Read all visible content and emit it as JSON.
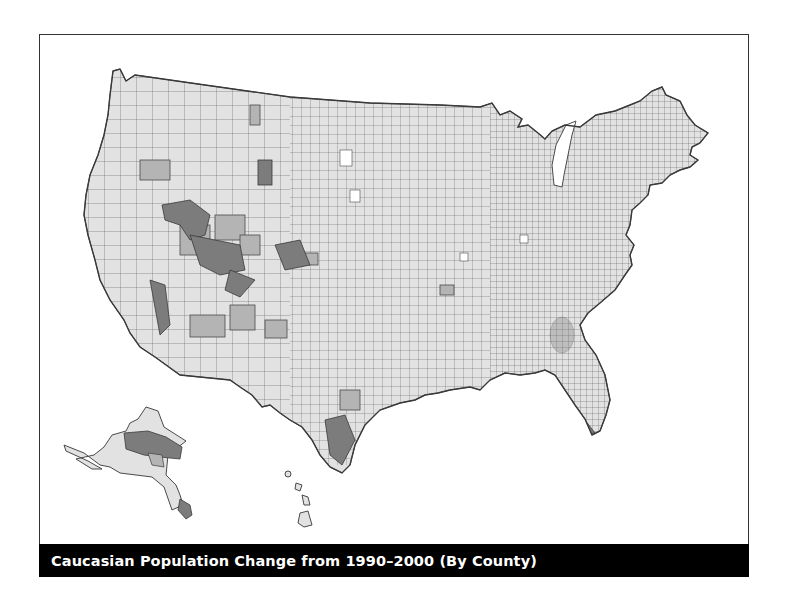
{
  "figure": {
    "caption": "Caucasian Population Change from 1990–2000 (By County)",
    "map_subject": "United States counties",
    "regions_shown": [
      "Contiguous United States",
      "Alaska",
      "Hawaii"
    ],
    "shading_levels": [
      {
        "name": "white",
        "color": "#ffffff"
      },
      {
        "name": "light",
        "color": "#e2e2e2"
      },
      {
        "name": "medium",
        "color": "#b4b4b4"
      },
      {
        "name": "dark",
        "color": "#7c7c7c"
      }
    ]
  }
}
